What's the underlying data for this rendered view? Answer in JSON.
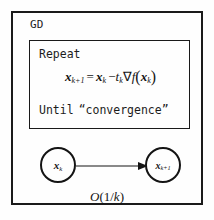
{
  "figure": {
    "title_label": "GD",
    "background_color": "#fefefe",
    "line_color": "#1a1a1a"
  },
  "algorithm_box": {
    "repeat_label": "Repeat",
    "until_label": "Until",
    "until_condition": "“convergence”",
    "update_rule": {
      "lhs_var": "x",
      "lhs_sub": "k+1",
      "equals": "=",
      "rhs_var": "x",
      "rhs_sub": "k",
      "minus": "−",
      "step_var": "t",
      "step_sub": "k",
      "gradient_op": "∇",
      "function_name": "f",
      "open_paren": "(",
      "arg_var": "x",
      "arg_sub": "k",
      "close_paren": ")",
      "plain_text": "x_{k+1} = x_k - t_k ∇f(x_k)"
    }
  },
  "graph": {
    "nodes": [
      {
        "id": "node-xk",
        "var": "x",
        "sub": "k"
      },
      {
        "id": "node-xk1",
        "var": "x",
        "sub": "k+1"
      }
    ],
    "edge": {
      "from": "node-xk",
      "to": "node-xk1",
      "style": "arrow"
    },
    "rate_label": {
      "operator": "O",
      "open_paren": "(",
      "numerator": "1",
      "slash": "/",
      "denominator": "k",
      "close_paren": ")",
      "plain_text": "O(1/k)"
    }
  }
}
